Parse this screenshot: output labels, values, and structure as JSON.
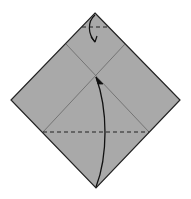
{
  "diagram": {
    "type": "origami-fold-step",
    "background": "#ffffff",
    "paper": {
      "shape": "square-diamond",
      "fill": "#a9a9a9",
      "stroke": "#222222",
      "vertices": {
        "top": [
          95,
          13
        ],
        "right": [
          180,
          100
        ],
        "bottom": [
          96,
          188
        ],
        "left": [
          11,
          100
        ]
      }
    },
    "creases": [
      {
        "from": [
          66,
          44
        ],
        "to": [
          149,
          132
        ],
        "style": "solid",
        "color": "#707070"
      },
      {
        "from": [
          125,
          44
        ],
        "to": [
          43,
          132
        ],
        "style": "solid",
        "color": "#707070"
      }
    ],
    "fold_lines": [
      {
        "name": "top-valley-fold",
        "from": [
          82,
          27
        ],
        "to": [
          109,
          27
        ],
        "style": "dashed",
        "color": "#222222"
      },
      {
        "name": "bottom-valley-fold",
        "from": [
          43,
          132
        ],
        "to": [
          149,
          132
        ],
        "style": "dashed",
        "color": "#222222"
      }
    ],
    "arrows": [
      {
        "name": "fold-top-down-arrow",
        "path": "M95,15 C88,22 88,34 95,42",
        "tip": [
          95,
          42
        ]
      },
      {
        "name": "fold-bottom-up-arrow",
        "path": "M96,187 C108,155 108,110 96,77",
        "tip": [
          96,
          77
        ]
      }
    ]
  }
}
